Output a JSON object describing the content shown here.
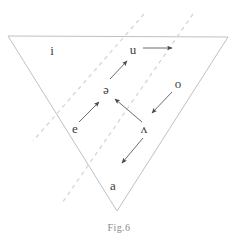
{
  "figure": {
    "caption": "Fig.6",
    "type": "vowel-triangle-diagram",
    "colors": {
      "triangle_stroke": "#b9b9b9",
      "dashed_stroke": "#d8d8d8",
      "arrow_stroke": "#5a5a5a",
      "label_text": "#3d3d3d",
      "caption_text": "#8a8a8a",
      "background": "#ffffff"
    },
    "triangle": {
      "name": "vowel-triangle",
      "vertices": [
        {
          "x": 8,
          "y": 36
        },
        {
          "x": 228,
          "y": 37
        },
        {
          "x": 117,
          "y": 211
        }
      ]
    },
    "dashed_lines": [
      {
        "name": "dashed-line-left",
        "x1": 144,
        "y1": 14,
        "x2": 33,
        "y2": 141
      },
      {
        "name": "dashed-line-right",
        "x1": 193,
        "y1": 14,
        "x2": 62,
        "y2": 203
      }
    ],
    "vowels": [
      {
        "id": "i",
        "symbol": "i",
        "x": 52,
        "y": 50
      },
      {
        "id": "u",
        "symbol": "u",
        "x": 133,
        "y": 49
      },
      {
        "id": "o",
        "symbol": "o",
        "x": 178,
        "y": 83
      },
      {
        "id": "schwa",
        "symbol": "ə",
        "x": 106,
        "y": 89
      },
      {
        "id": "e",
        "symbol": "e",
        "x": 75,
        "y": 128
      },
      {
        "id": "caret",
        "symbol": "ʌ",
        "x": 144,
        "y": 128
      },
      {
        "id": "a",
        "symbol": "a",
        "x": 113,
        "y": 185
      }
    ],
    "arrows": [
      {
        "name": "arrow-u-to-right",
        "from": "u",
        "to": "right-edge",
        "x1": 143,
        "y1": 48,
        "x2": 172,
        "y2": 48
      },
      {
        "name": "arrow-schwa-to-u",
        "from": "schwa",
        "to": "u",
        "x1": 110,
        "y1": 79,
        "x2": 127,
        "y2": 61
      },
      {
        "name": "arrow-e-to-schwa",
        "from": "e",
        "to": "schwa",
        "x1": 79,
        "y1": 122,
        "x2": 99,
        "y2": 102
      },
      {
        "name": "arrow-caret-to-schwa",
        "from": "caret",
        "to": "schwa",
        "x1": 142,
        "y1": 122,
        "x2": 115,
        "y2": 99
      },
      {
        "name": "arrow-o-to-caret",
        "from": "o",
        "to": "caret",
        "x1": 172,
        "y1": 92,
        "x2": 152,
        "y2": 113
      },
      {
        "name": "arrow-caret-to-a",
        "from": "caret",
        "to": "a",
        "x1": 143,
        "y1": 138,
        "x2": 122,
        "y2": 163
      }
    ]
  }
}
